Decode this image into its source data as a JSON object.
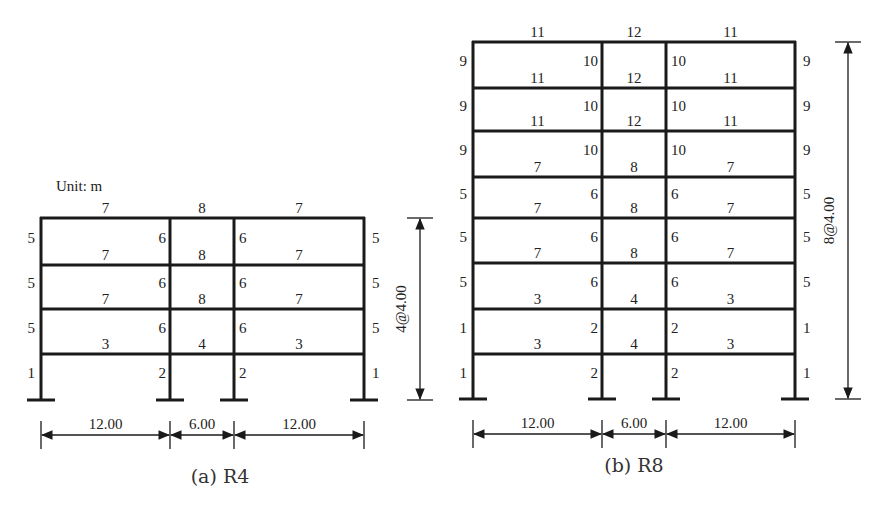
{
  "unit_label": "Unit: m",
  "frames": [
    {
      "id": "R4",
      "caption": "(a) R4",
      "columns_x": [
        41,
        170,
        234,
        364
      ],
      "floors_y": [
        400,
        354,
        309,
        265,
        218
      ],
      "beam_labels": [
        [
          "3",
          "4",
          "3"
        ],
        [
          "7",
          "8",
          "7"
        ],
        [
          "7",
          "8",
          "7"
        ],
        [
          "7",
          "8",
          "7"
        ]
      ],
      "column_labels": [
        [
          "1",
          "2",
          "2",
          "1"
        ],
        [
          "5",
          "6",
          "6",
          "5"
        ],
        [
          "5",
          "6",
          "6",
          "5"
        ],
        [
          "5",
          "6",
          "6",
          "5"
        ]
      ],
      "spans": [
        "12.00",
        "6.00",
        "12.00"
      ],
      "height_label": "4@4.00",
      "dim_x": 420,
      "caption_x": 220,
      "caption_y": 483
    },
    {
      "id": "R8",
      "caption": "(b) R8",
      "columns_x": [
        473,
        602,
        666,
        795
      ],
      "floors_y": [
        399,
        354,
        309,
        263,
        218,
        177,
        131,
        88,
        42
      ],
      "beam_labels": [
        [
          "3",
          "4",
          "3"
        ],
        [
          "3",
          "4",
          "3"
        ],
        [
          "7",
          "8",
          "7"
        ],
        [
          "7",
          "8",
          "7"
        ],
        [
          "7",
          "8",
          "7"
        ],
        [
          "11",
          "12",
          "11"
        ],
        [
          "11",
          "12",
          "11"
        ],
        [
          "11",
          "12",
          "11"
        ]
      ],
      "column_labels": [
        [
          "1",
          "2",
          "2",
          "1"
        ],
        [
          "1",
          "2",
          "2",
          "1"
        ],
        [
          "5",
          "6",
          "6",
          "5"
        ],
        [
          "5",
          "6",
          "6",
          "5"
        ],
        [
          "5",
          "6",
          "6",
          "5"
        ],
        [
          "9",
          "10",
          "10",
          "9"
        ],
        [
          "9",
          "10",
          "10",
          "9"
        ],
        [
          "9",
          "10",
          "10",
          "9"
        ]
      ],
      "spans": [
        "12.00",
        "6.00",
        "12.00"
      ],
      "height_label": "8@4.00",
      "dim_x": 848,
      "caption_x": 634,
      "caption_y": 472
    }
  ]
}
